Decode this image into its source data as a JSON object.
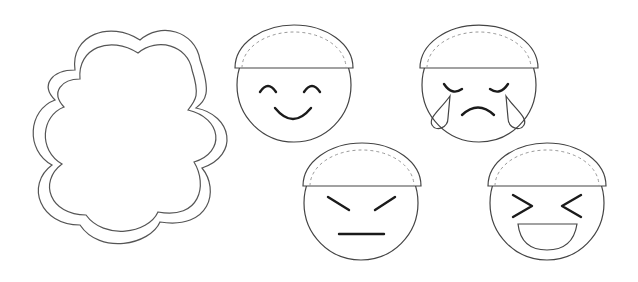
{
  "canvas": {
    "width": 638,
    "height": 282,
    "background": "#ffffff"
  },
  "colors": {
    "outline": "#444444",
    "feature": "#1a1a1a",
    "dashed": "#999999"
  },
  "shapes": {
    "cloud": {
      "label": "blank cloud frame",
      "style": "double outline scalloped cloud"
    },
    "faces": [
      {
        "name": "happy",
        "expression": "smiling closed eyes"
      },
      {
        "name": "crying",
        "expression": "sad with tears"
      },
      {
        "name": "angry",
        "expression": "slanted brows, flat mouth"
      },
      {
        "name": "laughing",
        "expression": "squinting > < eyes, open mouth"
      }
    ]
  }
}
